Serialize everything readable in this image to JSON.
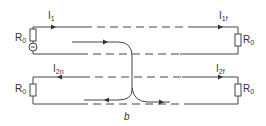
{
  "diagram": {
    "caption": "b",
    "labels": {
      "i1": "I",
      "i1_sub": "1",
      "i1f": "I",
      "i1f_sub": "1f",
      "i2n": "I",
      "i2n_sub": "2n",
      "i2f": "I",
      "i2f_sub": "2f",
      "r_top_left": "R",
      "r_top_left_sub": "0",
      "r_top_right": "R",
      "r_top_right_sub": "0",
      "r_bot_left": "R",
      "r_bot_left_sub": "0",
      "r_bot_right": "R",
      "r_bot_right_sub": "0"
    },
    "colors": {
      "line": "#444444",
      "background": "#ffffff"
    }
  }
}
